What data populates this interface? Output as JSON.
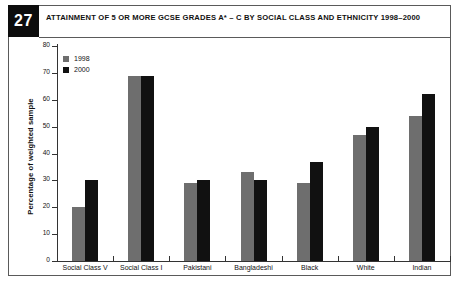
{
  "figure": {
    "number": "27",
    "title": "ATTAINMENT OF 5 OR MORE GCSE GRADES A* – C BY SOCIAL CLASS AND ETHNICITY 1998–2000"
  },
  "colors": {
    "series_1998": "#6e6e6e",
    "series_2000": "#111111",
    "axis": "#333333",
    "background": "#ffffff",
    "badge_background": "#0d0d0d",
    "badge_text": "#ffffff"
  },
  "chart_data": {
    "type": "bar",
    "title": "ATTAINMENT OF 5 OR MORE GCSE GRADES A* – C BY SOCIAL CLASS AND ETHNICITY 1998–2000",
    "xlabel": "",
    "ylabel": "Percentage of weighted sample",
    "ylim": [
      0,
      80
    ],
    "yticks": [
      0,
      10,
      20,
      30,
      40,
      50,
      60,
      70,
      80
    ],
    "grid": false,
    "legend_position": "top-left",
    "categories": [
      "Social Class V",
      "Social Class I",
      "Pakistani",
      "Bangladeshi",
      "Black",
      "White",
      "Indian"
    ],
    "series": [
      {
        "name": "1998",
        "values": [
          20,
          69,
          29,
          33,
          29,
          47,
          54
        ]
      },
      {
        "name": "2000",
        "values": [
          30,
          69,
          30,
          30,
          37,
          50,
          62
        ]
      }
    ]
  }
}
